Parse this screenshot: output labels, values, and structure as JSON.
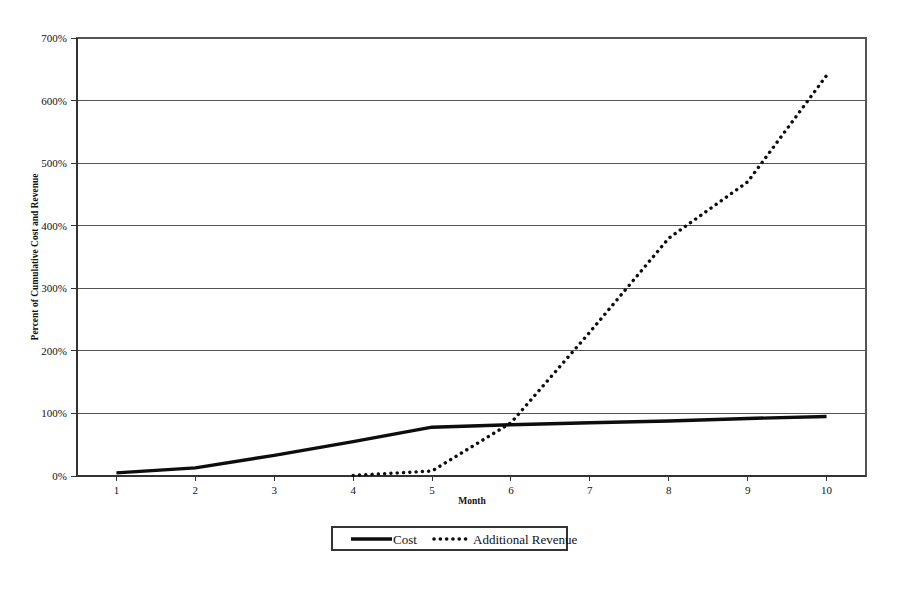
{
  "chart_data": {
    "type": "line",
    "title": "",
    "xlabel": "Month",
    "ylabel": "Percent of Cumulative Cost and Revenue",
    "x": [
      1,
      2,
      3,
      4,
      5,
      6,
      7,
      8,
      9,
      10
    ],
    "xlim": [
      0.5,
      10.5
    ],
    "ylim": [
      0,
      700
    ],
    "ytick_labels": [
      "0%",
      "100%",
      "200%",
      "300%",
      "400%",
      "500%",
      "600%",
      "700%"
    ],
    "ytick_values": [
      0,
      100,
      200,
      300,
      400,
      500,
      600,
      700
    ],
    "xtick_labels": [
      "1",
      "2",
      "3",
      "4",
      "5",
      "6",
      "7",
      "8",
      "9",
      "10"
    ],
    "grid": "horizontal",
    "legend_position": "bottom-center",
    "series": [
      {
        "name": "Cost",
        "style": "solid",
        "color": "#0d0d0d",
        "x": [
          1,
          2,
          3,
          4,
          5,
          6,
          7,
          8,
          9,
          10
        ],
        "values": [
          5,
          13,
          33,
          55,
          78,
          82,
          85,
          88,
          92,
          95
        ]
      },
      {
        "name": "Additional Revenue",
        "style": "dotted",
        "color": "#0d0d0d",
        "x": [
          4,
          5,
          6,
          7,
          8,
          9,
          10
        ],
        "values": [
          1,
          8,
          85,
          230,
          380,
          470,
          640
        ]
      }
    ]
  },
  "legend": {
    "items": [
      {
        "label": "Cost",
        "style": "solid"
      },
      {
        "label": "Additional Revenue",
        "style": "dotted"
      }
    ]
  },
  "colors": {
    "series": "#0d0d0d",
    "grid": "#555555",
    "axis": "#333333",
    "background": "#ffffff"
  }
}
